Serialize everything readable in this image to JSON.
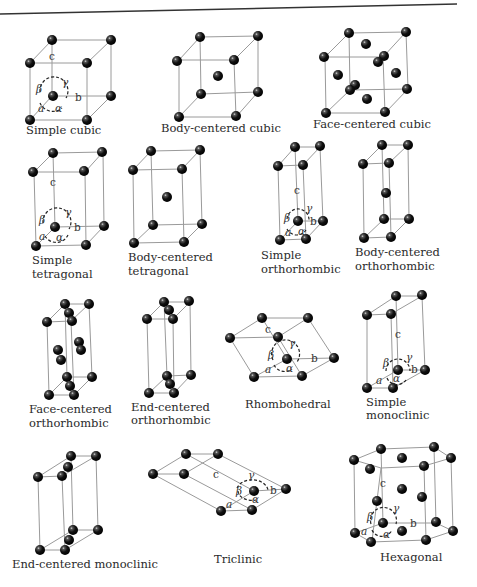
{
  "atom_color": "#111111",
  "edge_color": "#9a9a9a",
  "axis_labels": {
    "a": "a",
    "b": "b",
    "c": "c",
    "alpha": "α",
    "beta": "β",
    "gamma": "γ"
  },
  "lattices": [
    {
      "name": "Simple cubic",
      "caption": [
        "Simple cubic"
      ]
    },
    {
      "name": "Body-centered cubic",
      "caption": [
        "Body-centered cubic"
      ]
    },
    {
      "name": "Face-centered cubic",
      "caption": [
        "Face-centered cubic"
      ]
    },
    {
      "name": "Simple tetragonal",
      "caption": [
        "Simple",
        "tetragonal"
      ]
    },
    {
      "name": "Body-centered tetragonal",
      "caption": [
        "Body-centered",
        "tetragonal"
      ]
    },
    {
      "name": "Simple orthorhombic",
      "caption": [
        "Simple",
        "orthorhombic"
      ]
    },
    {
      "name": "Body-centered orthorhombic",
      "caption": [
        "Body-centered",
        "orthorhombic"
      ]
    },
    {
      "name": "Face-centered orthorhombic",
      "caption": [
        "Face-centered",
        "orthorhombic"
      ]
    },
    {
      "name": "End-centered orthorhombic",
      "caption": [
        "End-centered",
        "orthorhombic"
      ]
    },
    {
      "name": "Rhombohedral",
      "caption": [
        "Rhombohedral"
      ]
    },
    {
      "name": "Simple monoclinic",
      "caption": [
        "Simple",
        "monoclinic"
      ]
    },
    {
      "name": "End-centered monoclinic",
      "caption": [
        "End-centered monoclinic"
      ]
    },
    {
      "name": "Triclinic",
      "caption": [
        "Triclinic"
      ]
    },
    {
      "name": "Hexagonal",
      "caption": [
        "Hexagonal"
      ]
    }
  ]
}
